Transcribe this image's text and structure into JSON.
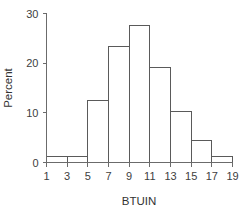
{
  "chart_data": {
    "type": "bar",
    "title": "",
    "subtitle": "",
    "xlabel": "BTUIN",
    "ylabel": "Percent",
    "xlim": [
      1,
      19
    ],
    "ylim": [
      0,
      30
    ],
    "grid": false,
    "legend": null,
    "bin_width": 2,
    "bin_edges": [
      1,
      3,
      5,
      7,
      9,
      11,
      13,
      15,
      17,
      19
    ],
    "categories": [
      "1-3",
      "3-5",
      "5-7",
      "7-9",
      "9-11",
      "11-13",
      "13-15",
      "15-17",
      "17-19"
    ],
    "values": [
      1.2,
      1.2,
      12.4,
      23.3,
      27.6,
      19.1,
      10.3,
      4.5,
      1.2
    ],
    "x_ticks": [
      "1",
      "3",
      "5",
      "7",
      "9",
      "11",
      "13",
      "15",
      "17",
      "19"
    ],
    "x_tick_values": [
      1,
      3,
      5,
      7,
      9,
      11,
      13,
      15,
      17,
      19
    ],
    "y_ticks": [
      "0",
      "10",
      "20",
      "30"
    ],
    "y_tick_values": [
      0,
      10,
      20,
      30
    ],
    "colors": {
      "bar_fill": "#ffffff",
      "bar_stroke": "#5a5a5a",
      "axis": "#6b6b6b",
      "text": "#333333",
      "background": "#ffffff"
    }
  }
}
